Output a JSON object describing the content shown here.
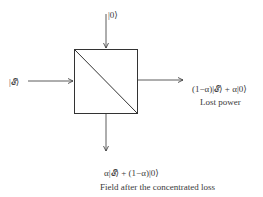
{
  "diagram": {
    "type": "beam-splitter-loss-model",
    "inputs": {
      "top": "|0⟩",
      "left": "|𝓔⟩"
    },
    "outputs": {
      "right": {
        "state": "(1−α)|𝓔⟩ + α|0⟩",
        "caption": "Lost power"
      },
      "bottom": {
        "state": "α|𝓔⟩ + (1−α)|0⟩",
        "caption": "Field after the concentrated loss"
      }
    },
    "colors": {
      "line": "#333333",
      "text": "#3a3a3a",
      "background": "#ffffff"
    }
  }
}
